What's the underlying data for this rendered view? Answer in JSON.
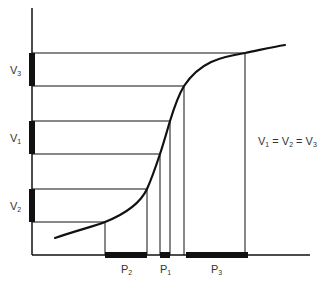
{
  "diagram": {
    "type": "pressure-volume relationship",
    "colors": {
      "line": "#111111",
      "text": "#333333",
      "background": "#ffffff"
    },
    "y_labels": [
      {
        "id": "V3",
        "base": "V",
        "sub": "3"
      },
      {
        "id": "V1",
        "base": "V",
        "sub": "1"
      },
      {
        "id": "V2",
        "base": "V",
        "sub": "2"
      }
    ],
    "x_labels": [
      {
        "id": "P2",
        "base": "P",
        "sub": "2"
      },
      {
        "id": "P1",
        "base": "P",
        "sub": "1"
      },
      {
        "id": "P3",
        "base": "P",
        "sub": "3"
      }
    ],
    "equation": {
      "parts": [
        {
          "base": "V",
          "sub": "1"
        },
        {
          "op": " = "
        },
        {
          "base": "V",
          "sub": "2"
        },
        {
          "op": " = "
        },
        {
          "base": "V",
          "sub": "3"
        }
      ]
    }
  }
}
